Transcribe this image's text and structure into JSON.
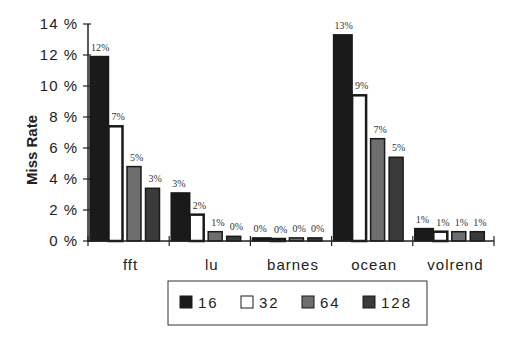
{
  "chart_data": {
    "type": "bar",
    "title": "",
    "xlabel": "",
    "ylabel": "Miss Rate",
    "ylim": [
      0,
      14
    ],
    "yticks": [
      "0%",
      "2%",
      "4%",
      "6%",
      "8%",
      "10%",
      "12%",
      "14%"
    ],
    "grid": false,
    "legend_position": "bottom",
    "categories": [
      "fft",
      "lu",
      "barnes",
      "ocean",
      "volrend"
    ],
    "series": [
      {
        "name": "16",
        "color": "#1a1a1a",
        "values": [
          11.9,
          3.1,
          0.2,
          13.3,
          0.8
        ],
        "labels": [
          "12%",
          "3%",
          "0%",
          "13%",
          "1%"
        ]
      },
      {
        "name": "32",
        "color": "#ffffff",
        "values": [
          7.4,
          1.7,
          0.1,
          9.4,
          0.6
        ],
        "labels": [
          "7%",
          "2%",
          "0%",
          "9%",
          "1%"
        ]
      },
      {
        "name": "64",
        "color": "#6e6e6e",
        "values": [
          4.8,
          0.6,
          0.2,
          6.6,
          0.6
        ],
        "labels": [
          "5%",
          "1%",
          "0%",
          "7%",
          "1%"
        ]
      },
      {
        "name": "128",
        "color": "#3a3a3a",
        "values": [
          3.4,
          0.3,
          0.2,
          5.4,
          0.6
        ],
        "labels": [
          "3%",
          "0%",
          "0%",
          "5%",
          "1%"
        ]
      }
    ]
  },
  "labels": {
    "ylabel": "Miss Rate"
  }
}
